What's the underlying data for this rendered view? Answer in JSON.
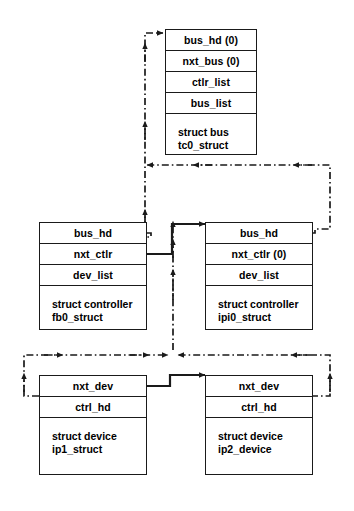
{
  "diagram": {
    "colors": {
      "line": "#1a1a1a",
      "background": "#ffffff",
      "text": "#000000"
    },
    "nodes": [
      {
        "id": "bus",
        "fields": [
          "bus_hd (0)",
          "nxt_bus (0)",
          "ctlr_list",
          "bus_list"
        ],
        "caption_line1": "struct bus",
        "caption_line2": "tc0_struct"
      },
      {
        "id": "controller_fb0",
        "fields": [
          "bus_hd",
          "nxt_ctlr",
          "dev_list"
        ],
        "caption_line1": "struct controller",
        "caption_line2": "fb0_struct"
      },
      {
        "id": "controller_ipi0",
        "fields": [
          "bus_hd",
          "nxt_ctlr (0)",
          "dev_list"
        ],
        "caption_line1": "struct controller",
        "caption_line2": "ipi0_struct"
      },
      {
        "id": "device_ip1",
        "fields": [
          "nxt_dev",
          "ctrl_hd"
        ],
        "caption_line1": "struct device",
        "caption_line2": "ip1_struct"
      },
      {
        "id": "device_ip2",
        "fields": [
          "nxt_dev",
          "ctrl_hd"
        ],
        "caption_line1": "struct device",
        "caption_line2": "ip2_device"
      }
    ]
  }
}
